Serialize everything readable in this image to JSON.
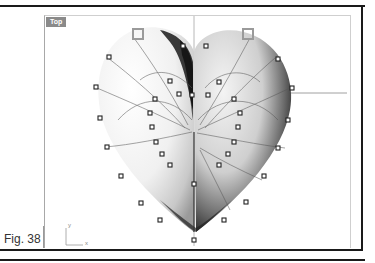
{
  "viewport": {
    "name": "Top",
    "axis_icon": {
      "y_label": "y",
      "x_label": "x"
    }
  },
  "figure": {
    "label": "Fig. 38"
  },
  "colors": {
    "frame": "#1a1a1a",
    "viewport_label_bg": "#8a8a8a",
    "control_point": "#222222",
    "gumball_handle": "#9a9a9a",
    "axis_line": "#b0b0b0"
  },
  "scene": {
    "object": "heart-surface",
    "control_points_visible": true,
    "gumball_handles": 2
  }
}
